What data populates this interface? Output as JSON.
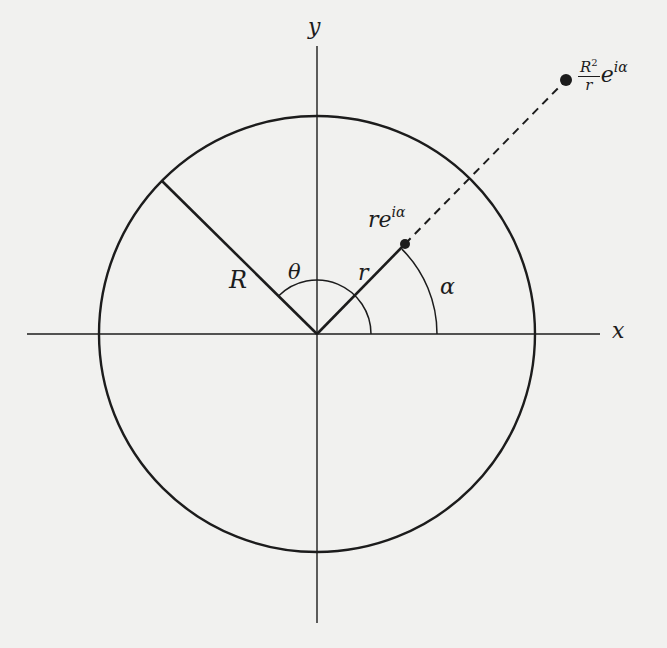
{
  "diagram": {
    "type": "complex-plane circle geometry",
    "colors": {
      "background": "#f1f1ef",
      "ink": "#1c1c1c"
    },
    "origin": [
      317,
      334
    ],
    "circle": {
      "center": [
        317,
        334
      ],
      "radius": 218
    },
    "axes": {
      "x": {
        "label": "x",
        "from": [
          27,
          334
        ],
        "to": [
          600,
          334
        ]
      },
      "y": {
        "label": "y",
        "from": [
          317,
          46
        ],
        "to": [
          317,
          623
        ]
      }
    },
    "segments": [
      {
        "name": "radius-R",
        "label": "R",
        "from": [
          317,
          334
        ],
        "to": [
          162,
          181
        ],
        "style": "solid-thick"
      },
      {
        "name": "segment-r",
        "label": "r",
        "from": [
          317,
          334
        ],
        "to": [
          405,
          244
        ],
        "style": "solid-thick"
      },
      {
        "name": "extension",
        "from": [
          405,
          244
        ],
        "to": [
          566,
          80
        ],
        "style": "dashed"
      }
    ],
    "points": [
      {
        "name": "point-re-i-alpha",
        "at": [
          405,
          244
        ]
      },
      {
        "name": "point-inverse",
        "at": [
          566,
          80
        ]
      }
    ],
    "arcs": [
      {
        "name": "theta-arc",
        "label": "θ",
        "radius": 54,
        "from_deg": 0,
        "to_deg": 135
      },
      {
        "name": "alpha-arc",
        "label": "α",
        "radius": 120,
        "from_deg": 0,
        "to_deg": 45
      }
    ]
  },
  "labels": {
    "y_axis": "y",
    "x_axis": "x",
    "R": "R",
    "theta": "θ",
    "r": "r",
    "alpha": "α",
    "re_i_alpha": {
      "base": "re",
      "exp": "iα"
    },
    "inverse_point": {
      "num": "R",
      "num_exp": "2",
      "den": "r",
      "base": "e",
      "exp": "iα"
    }
  }
}
